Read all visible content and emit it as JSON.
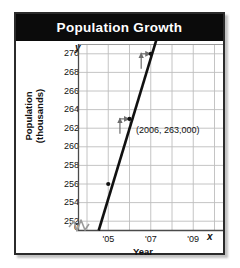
{
  "figure": {
    "title": "Population Growth",
    "border_color": "#2b2b2b",
    "banner_color": "#0b0b0b",
    "banner_text_color": "#ffffff"
  },
  "axis_letters": {
    "y": "y",
    "x": "x"
  },
  "annotation": {
    "point_label": "(2006, 263,000)"
  },
  "chart_data": {
    "type": "line",
    "title": "Population Growth",
    "xlabel": "Year",
    "ylabel": "Population (thousands)",
    "grid": true,
    "legend": "none",
    "x_tick_labels": [
      "'05",
      "'07",
      "'09"
    ],
    "x_tick_values": [
      2005,
      2007,
      2009
    ],
    "xlim": [
      2003.6,
      2010.4
    ],
    "y_tick_labels": [
      "270",
      "268",
      "266",
      "264",
      "262",
      "260",
      "258",
      "256",
      "254",
      "252",
      "0"
    ],
    "y_tick_values": [
      270,
      268,
      266,
      264,
      262,
      260,
      258,
      256,
      254,
      252,
      0
    ],
    "ylim": [
      251,
      271
    ],
    "y_axis_break": true,
    "y_axis_break_between": [
      0,
      252
    ],
    "series": [
      {
        "name": "Population",
        "x": [
          2004.55,
          2005,
          2006,
          2007,
          2007.45
        ],
        "y": [
          251.0,
          256.0,
          263.0,
          270.0,
          272.9
        ],
        "line_color": "#111111",
        "arrow_end": true,
        "marked_points": [
          {
            "x": 2005,
            "y": 256
          },
          {
            "x": 2006,
            "y": 263,
            "label": "(2006, 263,000)"
          },
          {
            "x": 2007,
            "y": 270
          }
        ]
      }
    ],
    "slope_triangles": [
      {
        "run_from_x": 2005.55,
        "run_to_x": 2006,
        "at_y": 263,
        "rise_from_y": 261.4,
        "rise_to_y": 263.1
      },
      {
        "run_from_x": 2006.55,
        "run_to_x": 2007,
        "at_y": 270,
        "rise_from_y": 268.4,
        "rise_to_y": 270.1
      }
    ]
  }
}
